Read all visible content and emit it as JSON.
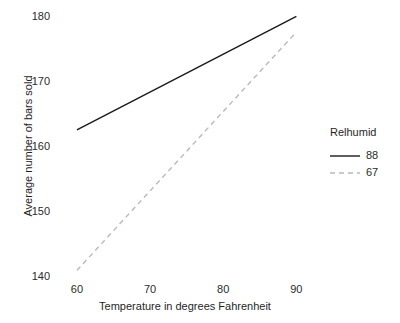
{
  "chart_data": {
    "type": "line",
    "title": "",
    "xlabel": "Temperature in degrees Fahrenheit",
    "ylabel": "Average number of bars sold",
    "xlim": [
      57,
      92
    ],
    "ylim": [
      139,
      181
    ],
    "xticks": [
      60,
      70,
      80,
      90
    ],
    "yticks": [
      140,
      150,
      160,
      170,
      180
    ],
    "xtick_labels": [
      "60",
      "70",
      "80",
      "90"
    ],
    "ytick_labels": [
      "140",
      "150",
      "160",
      "170",
      "180"
    ],
    "grid": false,
    "legend": {
      "title": "Relhumid",
      "position": "right",
      "entries": [
        {
          "label": "88",
          "style": "solid",
          "color": "#1a1a1a"
        },
        {
          "label": "67",
          "style": "dashed",
          "color": "#b9b9b9"
        }
      ]
    },
    "x": [
      60,
      90
    ],
    "series": [
      {
        "name": "88",
        "style": "solid",
        "color": "#1a1a1a",
        "values": [
          162.5,
          180.0
        ]
      },
      {
        "name": "67",
        "style": "dashed",
        "color": "#b9b9b9",
        "values": [
          140.8,
          177.6
        ]
      }
    ]
  }
}
